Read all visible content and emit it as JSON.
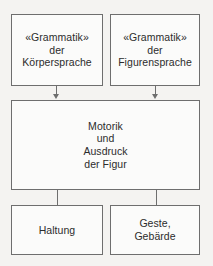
{
  "diagram": {
    "background_color": "#f4f3f1",
    "node_fill_color": "#fbfbfa",
    "border_color": "#6e6e6e",
    "text_color": "#2c2c2c",
    "nodes": [
      {
        "id": "koerpersprache",
        "lines": [
          "«Grammatik»",
          "der",
          "Körpersprache"
        ],
        "level": "top"
      },
      {
        "id": "figurensprache",
        "lines": [
          "«Grammatik»",
          "der",
          "Figurensprache"
        ],
        "level": "top"
      },
      {
        "id": "motorik",
        "lines": [
          "Motorik",
          "und",
          "Ausdruck",
          "der Figur"
        ],
        "level": "middle"
      },
      {
        "id": "haltung",
        "lines": [
          "Haltung"
        ],
        "level": "bottom"
      },
      {
        "id": "geste",
        "lines": [
          "Geste,",
          "Gebärde"
        ],
        "level": "bottom"
      }
    ],
    "edges": [
      {
        "from": "koerpersprache",
        "to": "motorik",
        "style": "arrow-down"
      },
      {
        "from": "figurensprache",
        "to": "motorik",
        "style": "arrow-down"
      },
      {
        "from": "motorik",
        "to": "haltung",
        "style": "line"
      },
      {
        "from": "motorik",
        "to": "geste",
        "style": "line"
      }
    ]
  }
}
